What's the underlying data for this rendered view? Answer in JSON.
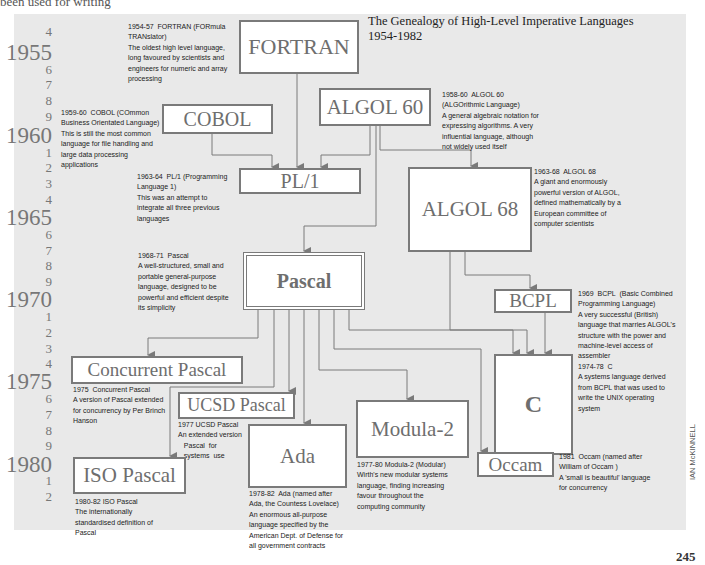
{
  "page": {
    "top_text": "been used for writing",
    "title_line1": "The Genealogy of High-Level Imperative Languages",
    "title_line2": "1954-1982",
    "credit": "IAN McKINNELL",
    "page_number": "245"
  },
  "timeline": [
    {
      "label": "4",
      "size": "small",
      "y": 24
    },
    {
      "label": "1955",
      "size": "big",
      "y": 40
    },
    {
      "label": "6",
      "size": "small",
      "y": 62
    },
    {
      "label": "7",
      "size": "small",
      "y": 77
    },
    {
      "label": "8",
      "size": "small",
      "y": 93
    },
    {
      "label": "9",
      "size": "small",
      "y": 109
    },
    {
      "label": "1960",
      "size": "big",
      "y": 123
    },
    {
      "label": "1",
      "size": "small",
      "y": 145
    },
    {
      "label": "2",
      "size": "small",
      "y": 160
    },
    {
      "label": "3",
      "size": "small",
      "y": 176
    },
    {
      "label": "4",
      "size": "small",
      "y": 192
    },
    {
      "label": "1965",
      "size": "big",
      "y": 205
    },
    {
      "label": "6",
      "size": "small",
      "y": 227
    },
    {
      "label": "7",
      "size": "small",
      "y": 243
    },
    {
      "label": "8",
      "size": "small",
      "y": 258
    },
    {
      "label": "9",
      "size": "small",
      "y": 274
    },
    {
      "label": "1970",
      "size": "big",
      "y": 287
    },
    {
      "label": "1",
      "size": "small",
      "y": 309
    },
    {
      "label": "2",
      "size": "small",
      "y": 325
    },
    {
      "label": "3",
      "size": "small",
      "y": 341
    },
    {
      "label": "4",
      "size": "small",
      "y": 356
    },
    {
      "label": "1975",
      "size": "big",
      "y": 369
    },
    {
      "label": "6",
      "size": "small",
      "y": 391
    },
    {
      "label": "7",
      "size": "small",
      "y": 407
    },
    {
      "label": "8",
      "size": "small",
      "y": 423
    },
    {
      "label": "9",
      "size": "small",
      "y": 438
    },
    {
      "label": "1980",
      "size": "big",
      "y": 452
    },
    {
      "label": "1",
      "size": "small",
      "y": 473
    },
    {
      "label": "2",
      "size": "small",
      "y": 489
    }
  ],
  "languages": [
    {
      "id": "fortran",
      "name": "FORTRAN",
      "x": 239,
      "y": 20,
      "w": 120,
      "h": 54,
      "fs": 22,
      "double": false,
      "note": {
        "x": 128,
        "y": 22,
        "w": 110,
        "lines": [
          "1954-57  FORTRAN (FORmula",
          "TRANslator)",
          "The oldest high level language,",
          "long favoured by scientists and",
          "engineers for numeric and array",
          "processing"
        ]
      }
    },
    {
      "id": "cobol",
      "name": "COBOL",
      "x": 162,
      "y": 104,
      "w": 111,
      "h": 30,
      "fs": 20,
      "double": false,
      "note": {
        "x": 61,
        "y": 108,
        "w": 102,
        "lines": [
          "1959-60  COBOL (COmmon",
          "Business Orientated Language)",
          "This is still the most common",
          "language for file handling and",
          "large data processing",
          "applications"
        ]
      }
    },
    {
      "id": "algol60",
      "name": "ALGOL 60",
      "x": 319,
      "y": 88,
      "w": 112,
      "h": 38,
      "fs": 21,
      "double": false,
      "note": {
        "x": 442,
        "y": 90,
        "w": 110,
        "lines": [
          "1958-60  ALGOL 60",
          "(ALGOrithmic Language)",
          "A general algebraic notation for",
          "expressing algorithms. A very",
          "influential language, although",
          "not widely used itself"
        ]
      }
    },
    {
      "id": "pl1",
      "name": "PL/1",
      "x": 239,
      "y": 168,
      "w": 122,
      "h": 26,
      "fs": 20,
      "double": false,
      "note": {
        "x": 137,
        "y": 172,
        "w": 100,
        "lines": [
          "1963-64  PL/1 (Programming",
          "Language 1)",
          "This was an attempt to",
          "integrate all three previous",
          "languages"
        ]
      }
    },
    {
      "id": "algol68",
      "name": "ALGOL 68",
      "x": 408,
      "y": 167,
      "w": 124,
      "h": 85,
      "fs": 21,
      "double": false,
      "note": {
        "x": 534,
        "y": 167,
        "w": 105,
        "lines": [
          "1963-68  ALGOL 68",
          "A giant and enormously",
          "powerful version of ALGOL,",
          "defined mathematically by a",
          "European committee of",
          "computer scientists"
        ]
      }
    },
    {
      "id": "pascal",
      "name": "Pascal",
      "x": 243,
      "y": 252,
      "w": 122,
      "h": 58,
      "fs": 20,
      "double": true,
      "bold": true,
      "note": {
        "x": 138,
        "y": 251,
        "w": 105,
        "lines": [
          "1968-71  Pascal",
          "A well-structured, small and",
          "portable general-purpose",
          "language, designed to be",
          "powerful and efficient despite",
          "its simplicity"
        ]
      }
    },
    {
      "id": "bcpl",
      "name": "BCPL",
      "x": 494,
      "y": 289,
      "w": 78,
      "h": 24,
      "fs": 19,
      "double": false,
      "note": {
        "x": 578,
        "y": 289,
        "w": 110,
        "lines": [
          "1969  BCPL  (Basic Combined",
          "Programming Language)",
          "A very successful (British)",
          "language that marries ALGOL's",
          "structure with the power and",
          "machine-level access of",
          "assembler"
        ]
      }
    },
    {
      "id": "c",
      "name": "C",
      "x": 494,
      "y": 354,
      "w": 79,
      "h": 101,
      "fs": 24,
      "double": false,
      "bold": true,
      "note": {
        "x": 578,
        "y": 362,
        "w": 110,
        "lines": [
          "1974-78  C",
          "A systems language derived",
          "from BCPL that was used to",
          "write the UNIX operating",
          "system"
        ]
      }
    },
    {
      "id": "concurrent-pascal",
      "name": "Concurrent Pascal",
      "x": 71,
      "y": 356,
      "w": 172,
      "h": 28,
      "fs": 19,
      "double": false,
      "note": {
        "x": 73,
        "y": 385,
        "w": 100,
        "lines": [
          "1975  Concurrent Pascal",
          "A version of Pascal extended",
          "for concurrency by Per Brinch",
          "Hanson"
        ]
      }
    },
    {
      "id": "ucsd-pascal",
      "name": "UCSD Pascal",
      "x": 178,
      "y": 392,
      "w": 117,
      "h": 27,
      "fs": 18,
      "double": false,
      "note": {
        "x": 178,
        "y": 420,
        "w": 70,
        "lines": [
          "1977 UCSD Pascal",
          "An extended version",
          "   Pascal  for",
          "   systems  use"
        ]
      }
    },
    {
      "id": "ada",
      "name": "Ada",
      "x": 248,
      "y": 424,
      "w": 99,
      "h": 64,
      "fs": 21,
      "double": false,
      "note": {
        "x": 249,
        "y": 489,
        "w": 100,
        "lines": [
          "1978-82  Ada (named after",
          "Ada, the Countess Lovelace)",
          "An enormous all-purpose",
          "language specified by the",
          "American Dept. of Defense for",
          "all government contracts"
        ]
      }
    },
    {
      "id": "modula2",
      "name": "Modula-2",
      "x": 356,
      "y": 400,
      "w": 113,
      "h": 58,
      "fs": 21,
      "double": false,
      "note": {
        "x": 357,
        "y": 460,
        "w": 110,
        "lines": [
          "1977-80 Modula-2 (Modular)",
          "Wirth's new modular systems",
          "language, finding increasing",
          "favour throughout the",
          "computing community"
        ]
      }
    },
    {
      "id": "occam",
      "name": "Occam",
      "x": 477,
      "y": 452,
      "w": 77,
      "h": 25,
      "fs": 19,
      "double": false,
      "note": {
        "x": 559,
        "y": 452,
        "w": 110,
        "lines": [
          "1981  Occam (named after",
          "William of Occam )",
          "A 'small is beautiful' language",
          "for concurrency"
        ]
      }
    },
    {
      "id": "iso-pascal",
      "name": "ISO Pascal",
      "x": 73,
      "y": 457,
      "w": 113,
      "h": 37,
      "fs": 21,
      "double": false,
      "note": {
        "x": 75,
        "y": 497,
        "w": 100,
        "lines": [
          "1980-82 ISO Pascal",
          "The internationally",
          "standardised definition of",
          "Pascal"
        ]
      }
    }
  ],
  "connectors": [
    {
      "from": "fortran",
      "to": "pl1",
      "points": [
        [
          297,
          74
        ],
        [
          297,
          168
        ]
      ]
    },
    {
      "from": "cobol",
      "to": "pl1",
      "points": [
        [
          212,
          134
        ],
        [
          212,
          155
        ],
        [
          272,
          155
        ],
        [
          272,
          168
        ]
      ]
    },
    {
      "from": "algol60",
      "to": "pl1",
      "points": [
        [
          370,
          126
        ],
        [
          370,
          155
        ],
        [
          321,
          155
        ],
        [
          321,
          168
        ]
      ]
    },
    {
      "from": "algol60",
      "to": "algol68",
      "points": [
        [
          380,
          126
        ],
        [
          380,
          150
        ],
        [
          471,
          150
        ],
        [
          471,
          167
        ]
      ]
    },
    {
      "from": "algol60",
      "to": "pascal",
      "points": [
        [
          376,
          126
        ],
        [
          376,
          226
        ],
        [
          304,
          226
        ],
        [
          304,
          252
        ]
      ]
    },
    {
      "from": "algol68",
      "to": "bcpl",
      "points": [
        [
          465,
          252
        ],
        [
          465,
          275
        ],
        [
          530,
          275
        ],
        [
          530,
          289
        ]
      ]
    },
    {
      "from": "algol68",
      "to": "c",
      "points": [
        [
          450,
          252
        ],
        [
          450,
          330
        ],
        [
          527,
          330
        ],
        [
          527,
          354
        ]
      ]
    },
    {
      "from": "bcpl",
      "to": "c",
      "points": [
        [
          545,
          313
        ],
        [
          545,
          354
        ]
      ]
    },
    {
      "from": "pascal",
      "to": "c",
      "points": [
        [
          349,
          310
        ],
        [
          349,
          330
        ],
        [
          513,
          330
        ],
        [
          513,
          354
        ]
      ]
    },
    {
      "from": "pascal",
      "to": "concurrent-pascal",
      "points": [
        [
          258,
          310
        ],
        [
          258,
          338
        ],
        [
          148,
          338
        ],
        [
          148,
          356
        ]
      ]
    },
    {
      "from": "pascal",
      "to": "iso-pascal",
      "points": [
        [
          274,
          310
        ],
        [
          274,
          387
        ],
        [
          170,
          387
        ],
        [
          170,
          457
        ]
      ]
    },
    {
      "from": "pascal",
      "to": "ucsd-pascal",
      "points": [
        [
          289,
          310
        ],
        [
          289,
          392
        ]
      ]
    },
    {
      "from": "pascal",
      "to": "ada",
      "points": [
        [
          304,
          310
        ],
        [
          304,
          424
        ]
      ]
    },
    {
      "from": "pascal",
      "to": "modula2",
      "points": [
        [
          319,
          310
        ],
        [
          319,
          370
        ],
        [
          407,
          370
        ],
        [
          407,
          400
        ]
      ]
    },
    {
      "from": "pascal",
      "to": "occam",
      "points": [
        [
          334,
          310
        ],
        [
          334,
          349
        ],
        [
          481,
          349
        ],
        [
          481,
          452
        ]
      ]
    }
  ],
  "colors": {
    "panel_bg": "#e9e9e9",
    "box_border": "#7a7a7a",
    "box_text": "#6e6e6e",
    "connector": "#7a7a7a",
    "year_text": "#777777"
  }
}
